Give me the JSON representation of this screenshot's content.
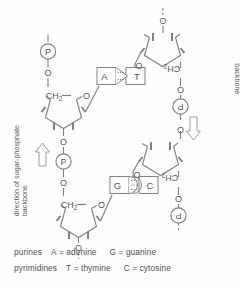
{
  "diagram": {
    "line_color": "#808080",
    "text_color": "#555555",
    "background": "#fefefe",
    "labels": {
      "left_direction": {
        "line1": "direction of sugar-phosphate",
        "line2": "backbone",
        "arrow": "up-arrow"
      },
      "right_direction": {
        "line1": "direction of sugar-phosphate",
        "line2": "backbone",
        "arrow": "down-arrow"
      }
    },
    "atoms": {
      "phosphate": "P",
      "oxygen": "O",
      "methylene": "CH",
      "methylene_sub": "2"
    },
    "base_pairs": [
      {
        "left": "A",
        "right": "T",
        "bonds": 2
      },
      {
        "left": "G",
        "right": "C",
        "bonds": 3
      }
    ]
  },
  "legend": {
    "rows": [
      {
        "category": "purines",
        "items": [
          {
            "code": "A",
            "eq": "=",
            "name": "adenine"
          },
          {
            "code": "G",
            "eq": "=",
            "name": "guanine"
          }
        ]
      },
      {
        "category": "pyrimidines",
        "items": [
          {
            "code": "T",
            "eq": "=",
            "name": "thymine"
          },
          {
            "code": "C",
            "eq": "=",
            "name": "cytosine"
          }
        ]
      }
    ]
  }
}
